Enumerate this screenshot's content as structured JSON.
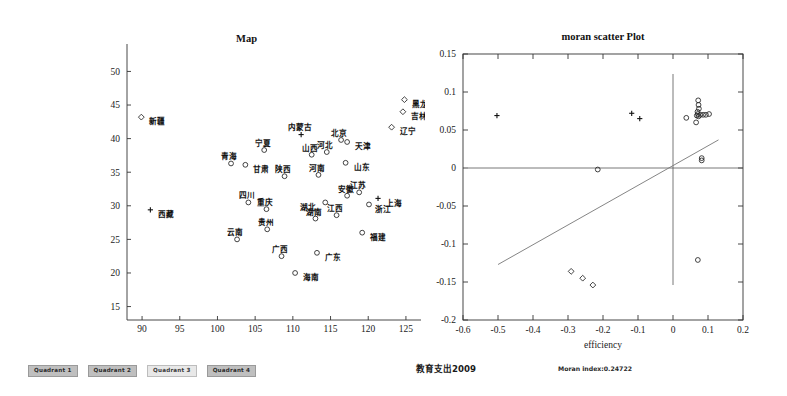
{
  "figure": {
    "caption_cn": "教育支出2009",
    "moran_caption": "Moran index:0.24722"
  },
  "legend": {
    "items": [
      {
        "label": "Quadrant 1",
        "style": "dark"
      },
      {
        "label": "Quadrant 2",
        "style": "dark"
      },
      {
        "label": "Quadrant 3",
        "style": "light"
      },
      {
        "label": "Quadrant 4",
        "style": "dark"
      }
    ]
  },
  "chart_data": [
    {
      "type": "scatter",
      "id": "map",
      "title": "Map",
      "xlabel": "",
      "ylabel": "",
      "xlim": [
        88,
        127
      ],
      "ylim": [
        13,
        52
      ],
      "xticks": [
        90,
        95,
        100,
        105,
        110,
        115,
        120,
        125
      ],
      "yticks": [
        15,
        20,
        25,
        30,
        35,
        40,
        45,
        50
      ],
      "grid": false,
      "legend_position": "below-figure",
      "points": [
        {
          "label": "新疆",
          "x": 89.9,
          "y": 43.2,
          "marker": "diamond",
          "label_dx": 5,
          "label_dy": 2.5
        },
        {
          "label": "黑龙江",
          "x": 124.8,
          "y": 45.8,
          "marker": "diamond",
          "label_dx": 5,
          "label_dy": 2.5
        },
        {
          "label": "吉林",
          "x": 124.6,
          "y": 44.0,
          "marker": "diamond",
          "label_dx": 5,
          "label_dy": 2.5
        },
        {
          "label": "辽宁",
          "x": 123.1,
          "y": 41.7,
          "marker": "diamond",
          "label_dx": 5,
          "label_dy": 2.5
        },
        {
          "label": "内蒙古",
          "x": 111.1,
          "y": 40.6,
          "marker": "plus",
          "label_dx": -1,
          "label_dy": -4.0
        },
        {
          "label": "北京",
          "x": 116.4,
          "y": 39.8,
          "marker": "circle",
          "label_dx": -1,
          "label_dy": -3.8
        },
        {
          "label": "天津",
          "x": 117.2,
          "y": 39.5,
          "marker": "circle",
          "label_dx": 5,
          "label_dy": 2.6
        },
        {
          "label": "宁夏",
          "x": 106.2,
          "y": 38.3,
          "marker": "circle",
          "label_dx": -1,
          "label_dy": -4.0
        },
        {
          "label": "河北",
          "x": 114.5,
          "y": 38.0,
          "marker": "circle",
          "label_dx": -1,
          "label_dy": -3.8
        },
        {
          "label": "山西",
          "x": 112.5,
          "y": 37.6,
          "marker": "circle",
          "label_dx": -1,
          "label_dy": -3.8
        },
        {
          "label": "青海",
          "x": 101.8,
          "y": 36.3,
          "marker": "circle",
          "label_dx": -1,
          "label_dy": -3.9
        },
        {
          "label": "甘肃",
          "x": 103.7,
          "y": 36.1,
          "marker": "circle",
          "label_dx": 5,
          "label_dy": 2.6
        },
        {
          "label": "山东",
          "x": 117.0,
          "y": 36.4,
          "marker": "circle",
          "label_dx": 5,
          "label_dy": 2.6
        },
        {
          "label": "陕西",
          "x": 108.9,
          "y": 34.4,
          "marker": "circle",
          "label_dx": -1,
          "label_dy": -3.8
        },
        {
          "label": "河南",
          "x": 113.4,
          "y": 34.6,
          "marker": "circle",
          "label_dx": -1,
          "label_dy": -3.8
        },
        {
          "label": "江苏",
          "x": 118.8,
          "y": 32.0,
          "marker": "circle",
          "label_dx": -1,
          "label_dy": -3.8
        },
        {
          "label": "四川",
          "x": 104.1,
          "y": 30.5,
          "marker": "circle",
          "label_dx": -1,
          "label_dy": -3.8
        },
        {
          "label": "上海",
          "x": 121.3,
          "y": 31.1,
          "marker": "plus",
          "label_dx": 5,
          "label_dy": 2.6
        },
        {
          "label": "湖北",
          "x": 114.3,
          "y": 30.5,
          "marker": "circle",
          "label_dx": -5.6,
          "label_dy": 2.6
        },
        {
          "label": "安徽",
          "x": 117.2,
          "y": 31.5,
          "marker": "circle",
          "label_dx": -1,
          "label_dy": -3.8
        },
        {
          "label": "浙江",
          "x": 120.1,
          "y": 30.2,
          "marker": "circle",
          "label_dx": 4,
          "label_dy": 3.0
        },
        {
          "label": "西藏",
          "x": 91.1,
          "y": 29.4,
          "marker": "plus",
          "label_dx": 5,
          "label_dy": 2.6
        },
        {
          "label": "重庆",
          "x": 106.5,
          "y": 29.5,
          "marker": "circle",
          "label_dx": -1,
          "label_dy": -3.8
        },
        {
          "label": "湖南",
          "x": 113.0,
          "y": 28.1,
          "marker": "circle",
          "label_dx": -1,
          "label_dy": -3.8
        },
        {
          "label": "江西",
          "x": 115.8,
          "y": 28.6,
          "marker": "circle",
          "label_dx": -1,
          "label_dy": -3.8
        },
        {
          "label": "贵州",
          "x": 106.6,
          "y": 26.5,
          "marker": "circle",
          "label_dx": -1,
          "label_dy": -3.8
        },
        {
          "label": "云南",
          "x": 102.6,
          "y": 25.0,
          "marker": "circle",
          "label_dx": -1,
          "label_dy": -3.9
        },
        {
          "label": "福建",
          "x": 119.2,
          "y": 26.0,
          "marker": "circle",
          "label_dx": 5,
          "label_dy": 2.6
        },
        {
          "label": "广东",
          "x": 113.2,
          "y": 23.0,
          "marker": "circle",
          "label_dx": 5,
          "label_dy": 2.6
        },
        {
          "label": "广西",
          "x": 108.5,
          "y": 22.5,
          "marker": "circle",
          "label_dx": -1,
          "label_dy": -3.8
        },
        {
          "label": "海南",
          "x": 110.3,
          "y": 20.0,
          "marker": "circle",
          "label_dx": 5,
          "label_dy": 2.6
        }
      ]
    },
    {
      "type": "scatter",
      "id": "moran",
      "title": "moran scatter Plot",
      "xlabel": "efficiency",
      "ylabel": "",
      "xlim": [
        -0.6,
        0.2
      ],
      "ylim": [
        -0.2,
        0.15
      ],
      "xticks": [
        -0.6,
        -0.5,
        -0.4,
        -0.3,
        -0.2,
        -0.1,
        0,
        0.1,
        0.2
      ],
      "yticks": [
        0.15,
        0.1,
        0.05,
        0,
        -0.05,
        -0.1,
        -0.15,
        -0.2
      ],
      "grid": false,
      "moran_index": 0.24722,
      "reference_lines": {
        "h": 0,
        "v": 0
      },
      "fit_line": {
        "x1": -0.5,
        "y1": -0.127,
        "x2": 0.13,
        "y2": 0.037
      },
      "points": [
        {
          "x": -0.503,
          "y": 0.069,
          "marker": "plus"
        },
        {
          "x": -0.118,
          "y": 0.072,
          "marker": "plus"
        },
        {
          "x": -0.095,
          "y": 0.065,
          "marker": "plus"
        },
        {
          "x": -0.215,
          "y": -0.002,
          "marker": "circle"
        },
        {
          "x": 0.038,
          "y": 0.066,
          "marker": "circle"
        },
        {
          "x": 0.072,
          "y": 0.089,
          "marker": "circle"
        },
        {
          "x": 0.073,
          "y": 0.083,
          "marker": "circle"
        },
        {
          "x": 0.074,
          "y": 0.078,
          "marker": "circle"
        },
        {
          "x": 0.07,
          "y": 0.074,
          "marker": "circle"
        },
        {
          "x": 0.071,
          "y": 0.071,
          "marker": "circle"
        },
        {
          "x": 0.068,
          "y": 0.069,
          "marker": "circle"
        },
        {
          "x": 0.073,
          "y": 0.068,
          "marker": "circle"
        },
        {
          "x": 0.078,
          "y": 0.07,
          "marker": "circle"
        },
        {
          "x": 0.086,
          "y": 0.07,
          "marker": "circle"
        },
        {
          "x": 0.094,
          "y": 0.07,
          "marker": "circle"
        },
        {
          "x": 0.103,
          "y": 0.071,
          "marker": "circle"
        },
        {
          "x": 0.066,
          "y": 0.06,
          "marker": "circle"
        },
        {
          "x": 0.082,
          "y": 0.013,
          "marker": "circle"
        },
        {
          "x": 0.082,
          "y": 0.01,
          "marker": "circle"
        },
        {
          "x": 0.071,
          "y": -0.121,
          "marker": "circle"
        },
        {
          "x": -0.291,
          "y": -0.136,
          "marker": "diamond"
        },
        {
          "x": -0.258,
          "y": -0.145,
          "marker": "diamond"
        },
        {
          "x": -0.229,
          "y": -0.154,
          "marker": "diamond"
        }
      ]
    }
  ]
}
